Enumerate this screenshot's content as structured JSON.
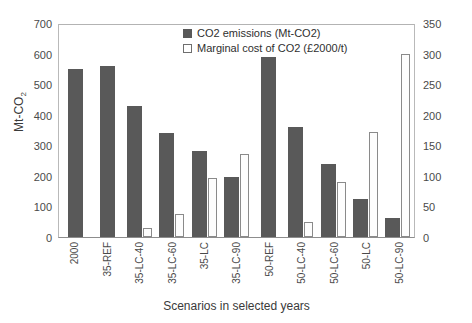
{
  "chart_data": {
    "type": "bar",
    "title": "",
    "xlabel": "Scenarios in selected years",
    "ylabel": "Mt-CO2",
    "ylabel_main": "Mt-CO",
    "ylabel_sub": "2",
    "y2label": "",
    "ylim": [
      0,
      700
    ],
    "y2lim": [
      0,
      350
    ],
    "yticks": [
      0,
      100,
      200,
      300,
      400,
      500,
      600,
      700
    ],
    "y2ticks": [
      0,
      50,
      100,
      150,
      200,
      250,
      300,
      350
    ],
    "grid": true,
    "legend_position": "top-center",
    "categories": [
      "2000",
      "35-REF",
      "35-LC-40",
      "35-LC-60",
      "35-LC",
      "35-LC-90",
      "50-REF",
      "50-LC-40",
      "50-LC-60",
      "50-LC",
      "50-LC-90"
    ],
    "series": [
      {
        "name": "CO2 emissions (Mt-CO2)",
        "axis": "left",
        "color": "#595959",
        "values": [
          550,
          560,
          430,
          340,
          280,
          195,
          590,
          360,
          240,
          125,
          62
        ]
      },
      {
        "name": "Marginal cost of CO2 (£2000/t)",
        "axis": "right",
        "color": "#ffffff",
        "values": [
          0,
          0,
          15,
          37,
          97,
          135,
          0,
          25,
          90,
          171,
          299
        ]
      }
    ]
  },
  "legend": {
    "items": [
      {
        "label": "CO2 emissions (Mt-CO2)",
        "swatch": "dark"
      },
      {
        "label": "Marginal cost of CO2 (£2000/t)",
        "swatch": "light"
      }
    ]
  },
  "axis": {
    "x_title": "Scenarios in selected years",
    "y_left_main": "Mt-CO",
    "y_left_sub": "2"
  }
}
